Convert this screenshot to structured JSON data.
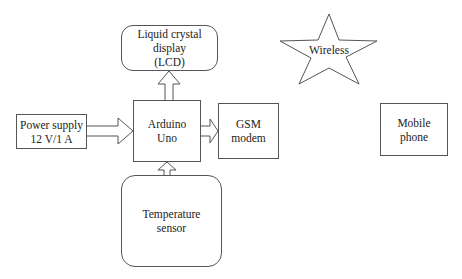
{
  "diagram": {
    "type": "block-diagram",
    "nodes": {
      "lcd": {
        "lines": [
          "Liquid crystal",
          "display",
          "(LCD)"
        ],
        "shape": "rounded-rect"
      },
      "arduino": {
        "lines": [
          "Arduino",
          "Uno"
        ],
        "shape": "rect"
      },
      "power": {
        "lines": [
          "Power supply",
          "12 V/1 A"
        ],
        "shape": "rect"
      },
      "gsm": {
        "lines": [
          "GSM",
          "modem"
        ],
        "shape": "rect"
      },
      "temp": {
        "lines": [
          "Temperature",
          "sensor"
        ],
        "shape": "rounded-rect"
      },
      "wireless": {
        "label": "Wireless",
        "shape": "star"
      },
      "mobile": {
        "lines": [
          "Mobile",
          "phone"
        ],
        "shape": "rect"
      }
    },
    "edges": [
      {
        "from": "arduino",
        "to": "lcd",
        "style": "block-arrow"
      },
      {
        "from": "power",
        "to": "arduino",
        "style": "block-arrow"
      },
      {
        "from": "arduino",
        "to": "gsm",
        "style": "block-arrow"
      },
      {
        "from": "temp",
        "to": "arduino",
        "style": "block-arrow"
      }
    ],
    "colors": {
      "stroke": "#555555",
      "fill": "#ffffff",
      "text": "#222222"
    }
  }
}
